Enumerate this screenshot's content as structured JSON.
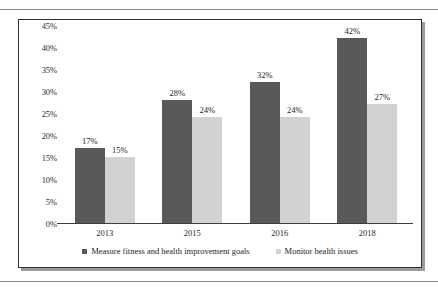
{
  "chart_data": {
    "type": "bar",
    "title": "",
    "subtitle": "",
    "xlabel": "",
    "ylabel": "",
    "categories": [
      "2013",
      "2015",
      "2016",
      "2018"
    ],
    "series": [
      {
        "name": "Measure fitness and health improvement goals",
        "color": "#595959",
        "values": [
          17,
          28,
          32,
          42
        ],
        "labels": [
          "17%",
          "28%",
          "32%",
          "42%"
        ]
      },
      {
        "name": "Monitor health issues",
        "color": "#d2d2d2",
        "values": [
          15,
          24,
          24,
          27
        ],
        "labels": [
          "15%",
          "24%",
          "24%",
          "27%"
        ]
      }
    ],
    "ylim": [
      0,
      45
    ],
    "ytick_values": [
      0,
      5,
      10,
      15,
      20,
      25,
      30,
      35,
      40,
      45
    ],
    "ytick_labels": [
      "0%",
      "5%",
      "10%",
      "15%",
      "20%",
      "25%",
      "30%",
      "35%",
      "40%",
      "45%"
    ],
    "grid": false,
    "legend_position": "bottom",
    "data_labels": true
  },
  "legend": {
    "items": [
      {
        "label": "Measure fitness and health improvement goals",
        "color": "#595959"
      },
      {
        "label": "Monitor health issues",
        "color": "#d2d2d2"
      }
    ]
  },
  "style": {
    "frame_border_color": "#2f2f2f",
    "shadow_color": "#9b9b9b",
    "page_rule_color": "#8a8a8a",
    "axis_color": "#3d3d3d",
    "text_color": "#2b2b2b",
    "background": "#ffffff"
  }
}
